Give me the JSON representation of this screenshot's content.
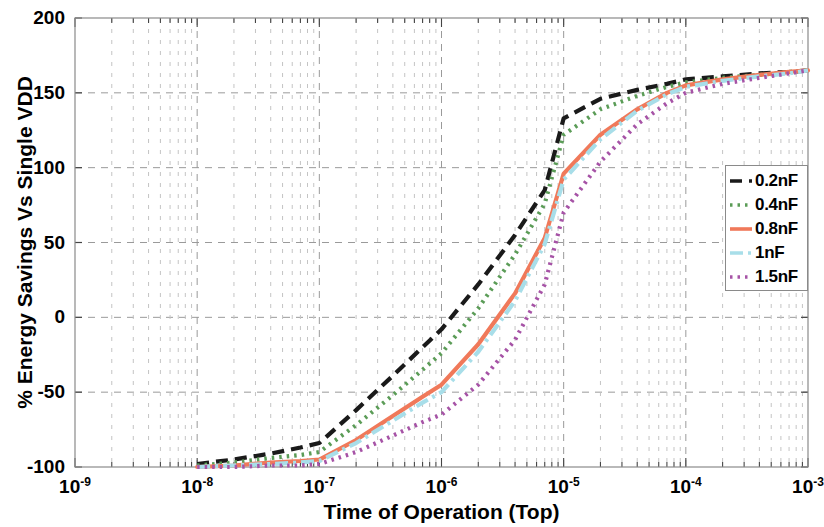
{
  "chart_data": {
    "type": "line",
    "title": "",
    "xlabel": "Time of Operation  (Top)",
    "ylabel": "% Energy Savings Vs Single VDD",
    "xscale": "log",
    "xlim": [
      1e-09,
      0.001
    ],
    "ylim": [
      -100,
      200
    ],
    "xticks": [
      1e-09,
      1e-08,
      1e-07,
      1e-06,
      1e-05,
      0.0001,
      0.001
    ],
    "xtick_labels": [
      "10-9",
      "10-8",
      "10-7",
      "10-6",
      "10-5",
      "10-4",
      "10-3"
    ],
    "xtick_mantissa": "10",
    "xtick_exponents": [
      "-9",
      "-8",
      "-7",
      "-6",
      "-5",
      "-4",
      "-3"
    ],
    "yticks": [
      -100,
      -50,
      0,
      50,
      100,
      150,
      200
    ],
    "ytick_labels": [
      "-100",
      "-50",
      "0",
      "50",
      "100",
      "150",
      "200"
    ],
    "grid": true,
    "grid_style": "dashed",
    "legend_position": "right",
    "series": [
      {
        "name": "0.2nF",
        "color": "#1a1a1a",
        "dash": "12,7",
        "width": 4.2,
        "x": [
          1e-08,
          2e-08,
          4e-08,
          7e-08,
          1e-07,
          2e-07,
          4e-07,
          7e-07,
          1e-06,
          2e-06,
          4e-06,
          7e-06,
          1e-05,
          2e-05,
          4e-05,
          7e-05,
          0.0001,
          0.0002,
          0.0004,
          0.0007,
          0.001
        ],
        "y": [
          -98,
          -95,
          -91,
          -87,
          -84,
          -62,
          -39,
          -20,
          -8,
          22,
          55,
          85,
          133,
          146,
          152,
          156,
          159,
          161,
          163,
          164,
          165
        ]
      },
      {
        "name": "0.4nF",
        "color": "#5b9c57",
        "dash": "2.5,5",
        "width": 4.2,
        "x": [
          1e-08,
          2e-08,
          4e-08,
          7e-08,
          1e-07,
          2e-07,
          4e-07,
          7e-07,
          1e-06,
          2e-06,
          4e-06,
          7e-06,
          1e-05,
          2e-05,
          4e-05,
          7e-05,
          0.0001,
          0.0002,
          0.0004,
          0.0007,
          0.001
        ],
        "y": [
          -99,
          -97,
          -94,
          -92,
          -90,
          -72,
          -52,
          -35,
          -24,
          6,
          42,
          76,
          122,
          139,
          148,
          154,
          157,
          160,
          162,
          164,
          165
        ]
      },
      {
        "name": "0.8nF",
        "color": "#f0795a",
        "dash": "none",
        "width": 4.2,
        "x": [
          1e-08,
          2e-08,
          4e-08,
          7e-08,
          1e-07,
          2e-07,
          4e-07,
          7e-07,
          1e-06,
          2e-06,
          4e-06,
          7e-06,
          1e-05,
          2e-05,
          4e-05,
          7e-05,
          0.0001,
          0.0002,
          0.0004,
          0.0007,
          0.001
        ],
        "y": [
          -100,
          -99,
          -97,
          -96,
          -95,
          -82,
          -66,
          -53,
          -45,
          -18,
          16,
          53,
          96,
          122,
          139,
          150,
          155,
          159,
          162,
          164,
          165
        ]
      },
      {
        "name": "1nF",
        "color": "#a8dee9",
        "dash": "13,5,3,5",
        "width": 4.2,
        "x": [
          1e-08,
          2e-08,
          4e-08,
          7e-08,
          1e-07,
          2e-07,
          4e-07,
          7e-07,
          1e-06,
          2e-06,
          4e-06,
          7e-06,
          1e-05,
          2e-05,
          4e-05,
          7e-05,
          0.0001,
          0.0002,
          0.0004,
          0.0007,
          0.001
        ],
        "y": [
          -100,
          -99,
          -98,
          -97,
          -96,
          -84,
          -69,
          -57,
          -50,
          -23,
          11,
          49,
          92,
          119,
          138,
          149,
          154,
          158,
          161,
          163,
          165
        ]
      },
      {
        "name": "1.5nF",
        "color": "#a653a6",
        "dash": "2.5,5",
        "width": 4.2,
        "x": [
          1e-08,
          2e-08,
          4e-08,
          7e-08,
          1e-07,
          2e-07,
          4e-07,
          7e-07,
          1e-06,
          2e-06,
          4e-06,
          7e-06,
          1e-05,
          2e-05,
          4e-05,
          7e-05,
          0.0001,
          0.0002,
          0.0004,
          0.0007,
          0.001
        ],
        "y": [
          -100,
          -100,
          -99,
          -99,
          -98,
          -90,
          -79,
          -70,
          -65,
          -45,
          -15,
          22,
          70,
          104,
          129,
          143,
          150,
          156,
          160,
          163,
          165
        ]
      }
    ]
  },
  "legend": {
    "items": [
      {
        "label": "0.2nF"
      },
      {
        "label": "0.4nF"
      },
      {
        "label": "0.8nF"
      },
      {
        "label": "1nF"
      },
      {
        "label": "1.5nF"
      }
    ]
  }
}
